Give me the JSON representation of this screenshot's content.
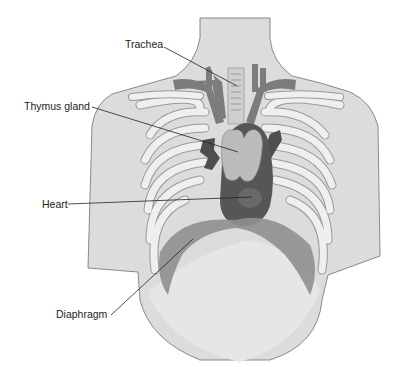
{
  "figure": {
    "labels": [
      {
        "id": "trachea",
        "text": "Trachea"
      },
      {
        "id": "thymus",
        "text": "Thymus gland"
      },
      {
        "id": "heart",
        "text": "Heart"
      },
      {
        "id": "diaphragm",
        "text": "Diaphragm"
      }
    ]
  },
  "colors": {
    "skin": "#d9d9d9",
    "skin_outline": "#6f6f6f",
    "rib": "#ededed",
    "rib_outline": "#9a9a9a",
    "lung_tissue": "#c4c4c4",
    "vessel": "#7a7a7a",
    "vessel_dark": "#4e4e4e",
    "thymus": "#b8b8b8",
    "heart": "#555555",
    "diaphragm": "#8e8e8e",
    "leader_line": "#222222"
  }
}
